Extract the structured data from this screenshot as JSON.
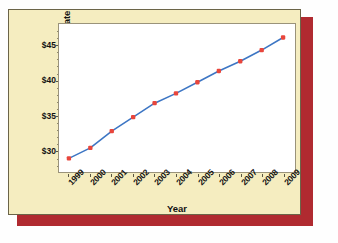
{
  "chart_data": {
    "type": "line",
    "title": "",
    "xlabel": "Year",
    "ylabel": "Average Basic Cable Rate",
    "categories": [
      "1999",
      "2000",
      "2001",
      "2002",
      "2003",
      "2004",
      "2005",
      "2006",
      "2007",
      "2008",
      "2009"
    ],
    "values": [
      28.9,
      30.4,
      32.8,
      34.8,
      36.8,
      38.2,
      39.8,
      41.4,
      42.8,
      44.4,
      46.2
    ],
    "series": [
      {
        "name": "Average Basic Cable Rate",
        "values": [
          28.9,
          30.4,
          32.8,
          34.8,
          36.8,
          38.2,
          39.8,
          41.4,
          42.8,
          44.4,
          46.2
        ]
      }
    ],
    "ytick_labels": [
      "$45",
      "$40",
      "$35",
      "$30"
    ],
    "ytick_values": [
      45,
      40,
      35,
      30
    ],
    "ylim": [
      27.8,
      47.0
    ],
    "grid": false,
    "legend": "none",
    "line_color": "#3d76c4",
    "marker_color": "#e8463c",
    "marker_shape": "square"
  },
  "figure": {
    "card_background": "#f5edc0",
    "card_border": "#6b6448",
    "shadow_color": "#b02a30",
    "plot_background": "#ffffff",
    "plot_border": "#9a937a",
    "text_color": "#121212"
  }
}
